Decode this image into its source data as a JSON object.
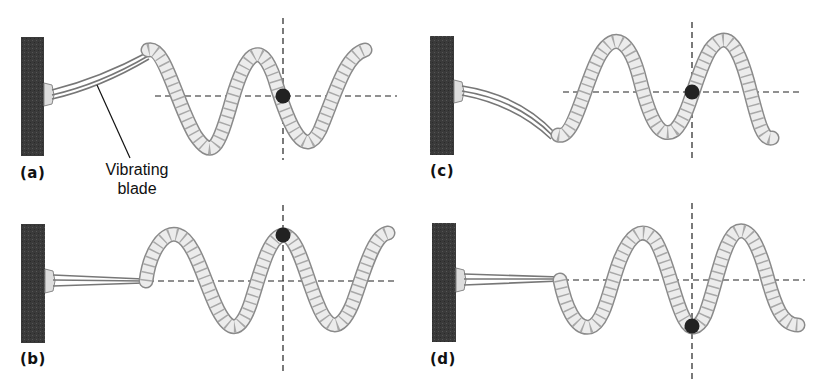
{
  "figure": {
    "panels": [
      {
        "id": "a",
        "label": "(a)",
        "dot_position": "equilibrium crossing (moving down)",
        "blade_state": "bent up"
      },
      {
        "id": "b",
        "label": "(b)",
        "dot_position": "crest",
        "blade_state": "straight"
      },
      {
        "id": "c",
        "label": "(c)",
        "dot_position": "equilibrium crossing (moving up)",
        "blade_state": "bent down"
      },
      {
        "id": "d",
        "label": "(d)",
        "dot_position": "trough",
        "blade_state": "straight"
      }
    ],
    "callout": {
      "line1": "Vibrating",
      "line2": "blade"
    },
    "colors": {
      "wall": "#3a3a3a",
      "rope_fill": "#e9e9e9",
      "rope_outline": "#8a8a8a",
      "rope_twist": "#a8a8a8",
      "dot": "#222222",
      "guide_line": "#222222",
      "background": "#ffffff"
    }
  }
}
